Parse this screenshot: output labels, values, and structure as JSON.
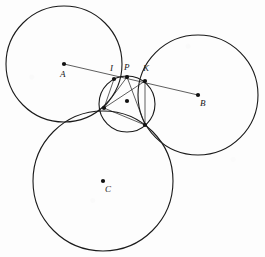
{
  "figure": {
    "background_color": "#fdfdfd",
    "stroke_color": "#1a1a1a",
    "width": 265,
    "height": 257
  },
  "circles": [
    {
      "name": "circle-a",
      "label": "A",
      "cx": 64,
      "cy": 64,
      "r": 58,
      "stroke_width": 1.1
    },
    {
      "name": "circle-b",
      "label": "B",
      "cx": 198,
      "cy": 95,
      "r": 60,
      "stroke_width": 1.1
    },
    {
      "name": "circle-c",
      "label": "C",
      "cx": 103,
      "cy": 181,
      "r": 70,
      "stroke_width": 1.1
    },
    {
      "name": "circle-inner",
      "label": "",
      "cx": 127,
      "cy": 104,
      "r": 28,
      "stroke_width": 1.1
    }
  ],
  "centers": [
    {
      "name": "center-a",
      "label": "A",
      "x": 64,
      "y": 64,
      "label_x": 60,
      "label_y": 70
    },
    {
      "name": "center-b",
      "label": "B",
      "x": 198,
      "y": 95,
      "label_x": 200,
      "label_y": 99
    },
    {
      "name": "center-c",
      "label": "C",
      "x": 103,
      "y": 181,
      "label_x": 105,
      "label_y": 185
    },
    {
      "name": "center-inner",
      "label": "",
      "x": 127,
      "y": 101,
      "label_x": 0,
      "label_y": 0
    }
  ],
  "marked_points": [
    {
      "name": "point-i",
      "label": "I",
      "x": 114,
      "y": 79,
      "label_x": 110,
      "label_y": 64
    },
    {
      "name": "point-p",
      "label": "P",
      "x": 127,
      "y": 77,
      "label_x": 124,
      "label_y": 63
    },
    {
      "name": "point-k",
      "label": "K",
      "x": 145,
      "y": 81,
      "label_x": 143,
      "label_y": 64
    },
    {
      "name": "point-left",
      "label": "",
      "x": 104,
      "y": 108,
      "label_x": 0,
      "label_y": 0
    },
    {
      "name": "point-lower-right",
      "label": "",
      "x": 145,
      "y": 125,
      "label_x": 0,
      "label_y": 0
    }
  ],
  "segments": [
    {
      "name": "segment-a-to-b",
      "x1": 64,
      "y1": 64,
      "x2": 198,
      "y2": 95
    },
    {
      "name": "segment-p-to-left",
      "x1": 127,
      "y1": 77,
      "x2": 104,
      "y2": 108
    },
    {
      "name": "segment-p-to-lower-right",
      "x1": 127,
      "y1": 77,
      "x2": 145,
      "y2": 125
    },
    {
      "name": "segment-i-to-left",
      "x1": 114,
      "y1": 79,
      "x2": 104,
      "y2": 108
    },
    {
      "name": "segment-k-to-lower-right",
      "x1": 145,
      "y1": 81,
      "x2": 145,
      "y2": 125
    },
    {
      "name": "segment-left-to-lower-right",
      "x1": 104,
      "y1": 108,
      "x2": 145,
      "y2": 125
    },
    {
      "name": "segment-left-to-k",
      "x1": 104,
      "y1": 108,
      "x2": 145,
      "y2": 81
    }
  ],
  "labels": {
    "a": "A",
    "b": "B",
    "c": "C",
    "i": "I",
    "p": "P",
    "k": "K"
  }
}
